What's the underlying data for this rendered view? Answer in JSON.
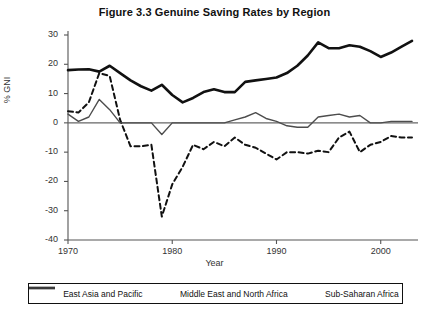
{
  "chart_data": {
    "type": "line",
    "title": "Figure 3.3  Genuine Saving Rates by Region",
    "xlabel": "Year",
    "ylabel": "% GNI",
    "xlim": [
      1970,
      2003
    ],
    "ylim": [
      -40,
      30
    ],
    "ytick_labels": [
      "30",
      "20",
      "10",
      "0",
      "-10",
      "-20",
      "-30",
      "-40"
    ],
    "ytick_values": [
      30,
      20,
      10,
      0,
      -10,
      -20,
      -30,
      -40
    ],
    "xtick_labels": [
      "1970",
      "1980",
      "1990",
      "2000"
    ],
    "xtick_values": [
      1970,
      1980,
      1990,
      2000
    ],
    "grid": false,
    "legend_position": "bottom",
    "x": [
      1970,
      1971,
      1972,
      1973,
      1974,
      1975,
      1976,
      1977,
      1978,
      1979,
      1980,
      1981,
      1982,
      1983,
      1984,
      1985,
      1986,
      1987,
      1988,
      1989,
      1990,
      1991,
      1992,
      1993,
      1994,
      1995,
      1996,
      1997,
      1998,
      1999,
      2000,
      2001,
      2002,
      2003
    ],
    "series": [
      {
        "name": "East Asia and Pacific",
        "style": "solid-thick",
        "color": "#111111",
        "values": [
          18.0,
          18.2,
          18.3,
          17.5,
          19.5,
          17.0,
          14.5,
          12.5,
          11.0,
          13.0,
          9.5,
          7.0,
          8.5,
          10.5,
          11.5,
          10.5,
          10.5,
          14.0,
          14.5,
          15.0,
          15.5,
          17.0,
          19.5,
          23.0,
          27.5,
          25.5,
          25.5,
          26.5,
          26.0,
          24.5,
          22.5,
          24.0,
          26.0,
          28.0
        ]
      },
      {
        "name": "Middle East and North Africa",
        "style": "dashed",
        "color": "#111111",
        "values": [
          4.0,
          3.5,
          7.0,
          17.0,
          16.0,
          1.0,
          -8.0,
          -8.0,
          -7.5,
          -32.0,
          -21.0,
          -15.0,
          -7.5,
          -9.0,
          -6.5,
          -8.0,
          -5.0,
          -7.5,
          -8.5,
          -10.5,
          -12.5,
          -10.0,
          -10.0,
          -10.5,
          -9.5,
          -10.0,
          -5.0,
          -3.0,
          -10.0,
          -7.5,
          -6.5,
          -4.5,
          -5.0,
          -5.0
        ]
      },
      {
        "name": "Sub-Saharan Africa",
        "style": "solid-thin",
        "color": "#4d4d4d",
        "values": [
          3.0,
          0.5,
          2.0,
          8.0,
          4.5,
          0.0,
          0.0,
          0.0,
          0.0,
          -4.0,
          0.0,
          0.0,
          0.0,
          0.0,
          0.0,
          0.0,
          1.0,
          2.0,
          3.5,
          1.5,
          0.5,
          -1.0,
          -1.5,
          -1.5,
          2.0,
          2.5,
          3.0,
          2.0,
          2.5,
          0.0,
          0.0,
          0.5,
          0.5,
          0.5
        ]
      }
    ]
  },
  "legend": {
    "items": [
      {
        "label": "East Asia and Pacific",
        "style": "solid-thick"
      },
      {
        "label": "Middle East and North Africa",
        "style": "dashed"
      },
      {
        "label": "Sub-Saharan Africa",
        "style": "solid-thin"
      }
    ]
  }
}
